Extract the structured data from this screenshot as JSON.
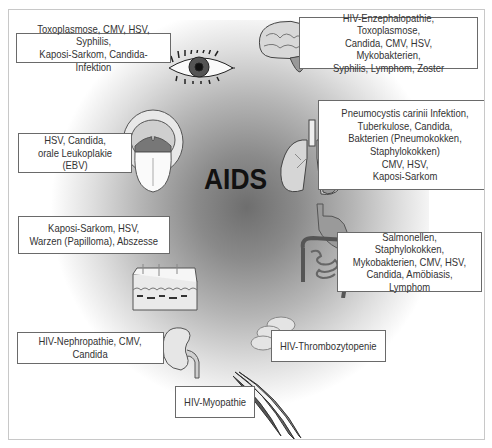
{
  "center_label": "AIDS",
  "organs": [
    {
      "id": "eye",
      "icon": "eye-icon",
      "label": "Toxoplasmose, CMV, HSV, Syphilis,\nKaposi-Sarkom, Candida-Infektion"
    },
    {
      "id": "brain",
      "icon": "brain-icon",
      "label": "HIV-Enzephalopathie, Toxoplasmose,\nCandida, CMV, HSV, Mykobakterien,\nSyphilis, Lymphom, Zoster"
    },
    {
      "id": "mouth",
      "icon": "mouth-icon",
      "label": "HSV, Candida,\norale Leukoplakie (EBV)"
    },
    {
      "id": "lungs",
      "icon": "lungs-icon",
      "label": "Pneumocystis carinii Infektion,\nTuberkulose, Candida,\nBakterien (Pneumokokken,\nStaphylokokken)\nCMV, HSV,\nKaposi-Sarkom"
    },
    {
      "id": "skin",
      "icon": "skin-icon",
      "label": "Kaposi-Sarkom, HSV,\nWarzen (Papilloma), Abszesse"
    },
    {
      "id": "intestine",
      "icon": "intestine-icon",
      "label": "Salmonellen, Staphylokokken,\nMykobakterien, CMV, HSV,\nCandida, Amöbiasis,\nLymphom"
    },
    {
      "id": "kidney",
      "icon": "kidney-icon",
      "label": "HIV-Nephropathie, CMV,\nCandida"
    },
    {
      "id": "platelets",
      "icon": "platelets-icon",
      "label": "HIV-Thrombozytopenie"
    },
    {
      "id": "muscle",
      "icon": "muscle-icon",
      "label": "HIV-Myopathie"
    }
  ]
}
